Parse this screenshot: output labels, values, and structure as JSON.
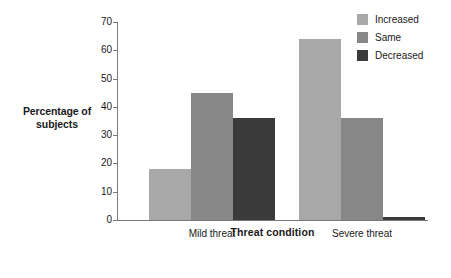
{
  "chart_data": {
    "type": "bar",
    "title": "",
    "xlabel": "Threat condition",
    "ylabel": "Percentage of subjects",
    "categories": [
      "Mild threat",
      "Severe threat"
    ],
    "series": [
      {
        "name": "Increased",
        "values": [
          18,
          64
        ],
        "color": "#a8a8a8"
      },
      {
        "name": "Same",
        "values": [
          45,
          36
        ],
        "color": "#878787"
      },
      {
        "name": "Decreased",
        "values": [
          36,
          1
        ],
        "color": "#3a3a3a"
      }
    ],
    "ylim": [
      0,
      70
    ],
    "yticks": [
      0,
      10,
      20,
      30,
      40,
      50,
      60,
      70
    ],
    "ytick_labels": [
      "0",
      "10",
      "20",
      "30",
      "40",
      "50",
      "60",
      "70"
    ],
    "grid": false,
    "legend_position": "top-right",
    "legend_entries": [
      "Increased",
      "Same",
      "Decreased"
    ],
    "axis_color": "#7a7a7a",
    "background": "#ffffff"
  },
  "axes": {
    "y_title_line1": "Percentage of",
    "y_title_line2": "subjects",
    "x_title": "Threat condition"
  }
}
